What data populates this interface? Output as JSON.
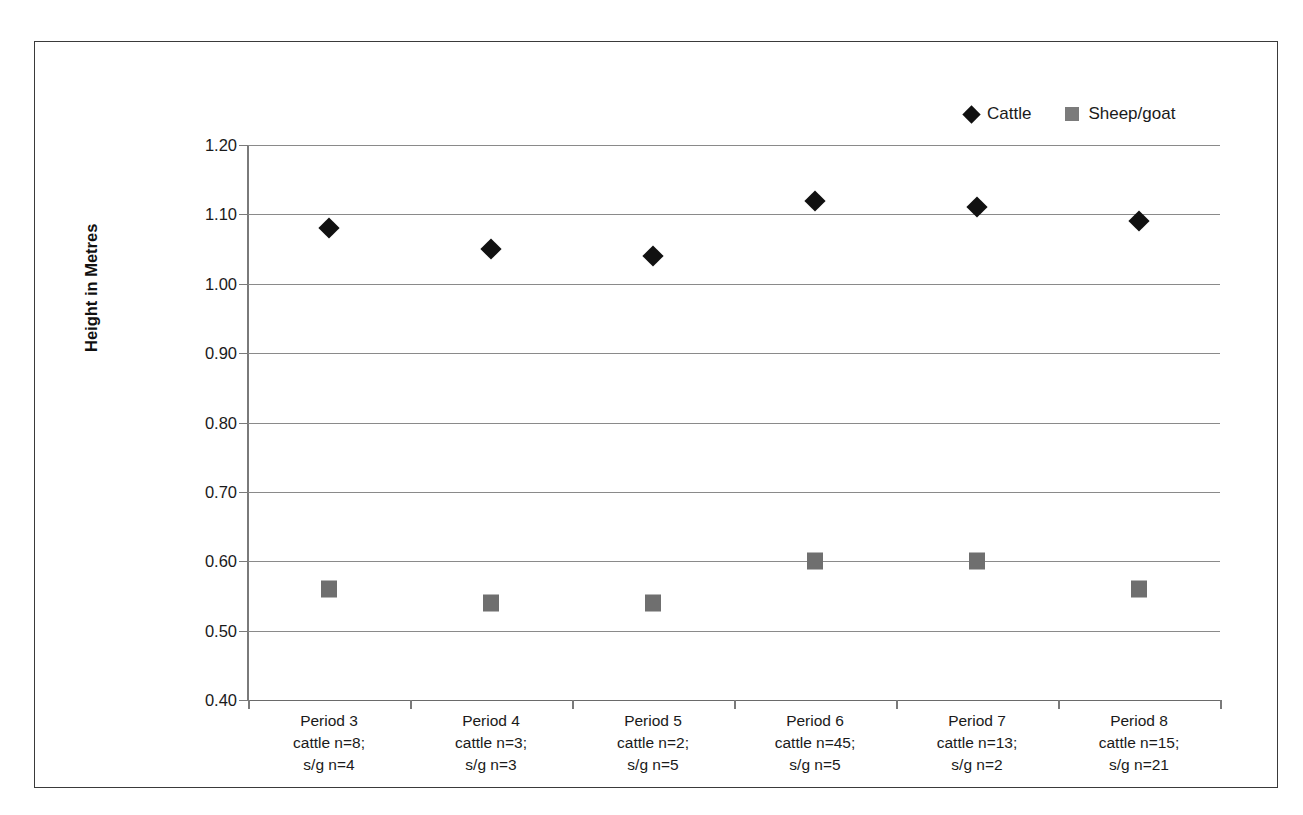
{
  "chart_data": {
    "type": "scatter",
    "title": "",
    "xlabel": "",
    "ylabel": "Height in Metres",
    "ylim": [
      0.4,
      1.2
    ],
    "ytick_step": 0.1,
    "grid": true,
    "legend_position": "top-right",
    "categories": [
      "Period 3",
      "Period 4",
      "Period 5",
      "Period 6",
      "Period 7",
      "Period 8"
    ],
    "category_sublabels": [
      [
        "cattle n=8;",
        "s/g n=4"
      ],
      [
        "cattle n=3;",
        "s/g n=3"
      ],
      [
        "cattle n=2;",
        "s/g n=5"
      ],
      [
        "cattle n=45;",
        "s/g n=5"
      ],
      [
        "cattle n=13;",
        "s/g n=2"
      ],
      [
        "cattle n=15;",
        "s/g n=21"
      ]
    ],
    "ytick_labels": [
      "1.20",
      "1.10",
      "1.00",
      "0.90",
      "0.80",
      "0.70",
      "0.60",
      "0.50",
      "0.40"
    ],
    "ytick_values": [
      1.2,
      1.1,
      1.0,
      0.9,
      0.8,
      0.7,
      0.6,
      0.5,
      0.4
    ],
    "series": [
      {
        "name": "Cattle",
        "marker": "diamond",
        "color": "#111111",
        "values": [
          1.08,
          1.05,
          1.04,
          1.12,
          1.11,
          1.09
        ]
      },
      {
        "name": "Sheep/goat",
        "marker": "square",
        "color": "#6f6f6f",
        "values": [
          0.56,
          0.54,
          0.54,
          0.6,
          0.6,
          0.56
        ]
      }
    ]
  },
  "legend": {
    "items": [
      {
        "label": "Cattle",
        "marker": "diamond-marker-icon"
      },
      {
        "label": "Sheep/goat",
        "marker": "square-marker-icon"
      }
    ]
  },
  "colors": {
    "cattle": "#111111",
    "sheep_goat": "#6f6f6f",
    "gridline": "#8a8a8a",
    "frame": "#3a3a3a",
    "text": "#1a1a1a"
  }
}
